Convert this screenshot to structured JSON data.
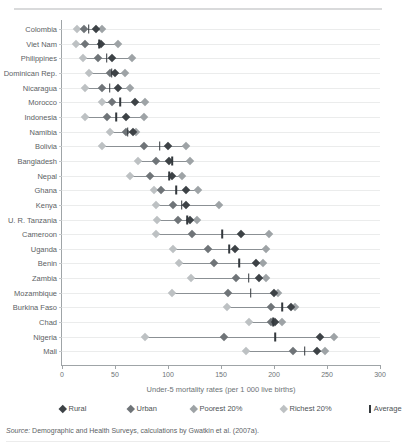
{
  "figure": {
    "top_rule": true,
    "xaxis_title": "Under-5 mortality rates (per 1 000 live births)",
    "source_prefix": "Source:",
    "source_text": " Demographic and Health Surveys, calculations by Gwatkin et al. (2007a)."
  },
  "legend": {
    "items": [
      {
        "label": "Rural",
        "key": "rural",
        "color": "#3d4246",
        "shape": "diamond"
      },
      {
        "label": "Urban",
        "key": "urban",
        "color": "#6f7478",
        "shape": "diamond"
      },
      {
        "label": "Poorest 20%",
        "key": "poorest",
        "color": "#9ea3a6",
        "shape": "diamond"
      },
      {
        "label": "Richest 20%",
        "key": "richest",
        "color": "#bdc1c3",
        "shape": "diamond"
      },
      {
        "label": "Average",
        "key": "average",
        "color": "#33383c",
        "shape": "bar"
      }
    ]
  },
  "colors": {
    "rural": "#3d4246",
    "urban": "#6f7478",
    "poorest": "#9ea3a6",
    "richest": "#bdc1c3",
    "average": "#33383c",
    "axis": "#9fa4a7",
    "gridline": "#ebecec",
    "connector": "#8b9094"
  },
  "chart_data": {
    "type": "scatter",
    "title": "",
    "xlabel": "Under-5 mortality rates (per 1 000 live births)",
    "ylabel": "",
    "xlim": [
      0,
      300
    ],
    "xticks": [
      0,
      50,
      100,
      150,
      200,
      250,
      300
    ],
    "grid": "horizontal",
    "legend_position": "bottom",
    "orientation": "horizontal-dotplot",
    "series": [
      {
        "name": "Rural",
        "key": "rural"
      },
      {
        "name": "Urban",
        "key": "urban"
      },
      {
        "name": "Poorest 20%",
        "key": "poorest"
      },
      {
        "name": "Richest 20%",
        "key": "richest"
      },
      {
        "name": "Average",
        "key": "average"
      }
    ],
    "categories": [
      "Colombia",
      "Viet Nam",
      "Philippines",
      "Dominican Rep.",
      "Nicaragua",
      "Morocco",
      "Indonesia",
      "Namibia",
      "Bolivia",
      "Bangladesh",
      "Nepal",
      "Ghana",
      "Kenya",
      "U. R. Tanzania",
      "Cameroon",
      "Uganda",
      "Benin",
      "Zambia",
      "Mozambique",
      "Burkina Faso",
      "Chad",
      "Nigeria",
      "Mali"
    ],
    "rows": [
      {
        "country": "Colombia",
        "rural": 32,
        "urban": 21,
        "poorest": 38,
        "richest": 14,
        "average": 25
      },
      {
        "country": "Viet Nam",
        "rural": 37,
        "urban": 22,
        "poorest": 53,
        "richest": 13,
        "average": 35
      },
      {
        "country": "Philippines",
        "rural": 47,
        "urban": 34,
        "poorest": 66,
        "richest": 20,
        "average": 42
      },
      {
        "country": "Dominican Rep.",
        "rural": 50,
        "urban": 45,
        "poorest": 59,
        "richest": 25,
        "average": 47
      },
      {
        "country": "Nicaragua",
        "rural": 53,
        "urban": 38,
        "poorest": 64,
        "richest": 22,
        "average": 45
      },
      {
        "country": "Morocco",
        "rural": 69,
        "urban": 47,
        "poorest": 78,
        "richest": 38,
        "average": 55
      },
      {
        "country": "Indonesia",
        "rural": 60,
        "urban": 42,
        "poorest": 77,
        "richest": 22,
        "average": 51
      },
      {
        "country": "Namibia",
        "rural": 67,
        "urban": 60,
        "poorest": 70,
        "richest": 45,
        "average": 62
      },
      {
        "country": "Bolivia",
        "rural": 100,
        "urban": 77,
        "poorest": 117,
        "richest": 38,
        "average": 92
      },
      {
        "country": "Bangladesh",
        "rural": 101,
        "urban": 89,
        "poorest": 121,
        "richest": 72,
        "average": 104
      },
      {
        "country": "Nepal",
        "rural": 104,
        "urban": 83,
        "poorest": 113,
        "richest": 64,
        "average": 101
      },
      {
        "country": "Ghana",
        "rural": 117,
        "urban": 93,
        "poorest": 128,
        "richest": 87,
        "average": 108
      },
      {
        "country": "Kenya",
        "rural": 117,
        "urban": 105,
        "poorest": 148,
        "richest": 89,
        "average": 113
      },
      {
        "country": "U. R. Tanzania",
        "rural": 121,
        "urban": 109,
        "poorest": 127,
        "richest": 90,
        "average": 118
      },
      {
        "country": "Cameroon",
        "rural": 169,
        "urban": 123,
        "poorest": 195,
        "richest": 89,
        "average": 151
      },
      {
        "country": "Uganda",
        "rural": 163,
        "urban": 138,
        "poorest": 192,
        "richest": 105,
        "average": 158
      },
      {
        "country": "Benin",
        "rural": 183,
        "urban": 143,
        "poorest": 190,
        "richest": 110,
        "average": 167
      },
      {
        "country": "Zambia",
        "rural": 186,
        "urban": 164,
        "poorest": 192,
        "richest": 122,
        "average": 176
      },
      {
        "country": "Mozambique",
        "rural": 200,
        "urban": 157,
        "poorest": 204,
        "richest": 104,
        "average": 178
      },
      {
        "country": "Burkina Faso",
        "rural": 216,
        "urban": 197,
        "poorest": 220,
        "richest": 156,
        "average": 208
      },
      {
        "country": "Chad",
        "rural": 201,
        "urban": 197,
        "poorest": 208,
        "richest": 176,
        "average": 199
      },
      {
        "country": "Nigeria",
        "rural": 243,
        "urban": 153,
        "poorest": 257,
        "richest": 78,
        "average": 201
      },
      {
        "country": "Mali",
        "rural": 241,
        "urban": 218,
        "poorest": 248,
        "richest": 174,
        "average": 229
      }
    ]
  }
}
